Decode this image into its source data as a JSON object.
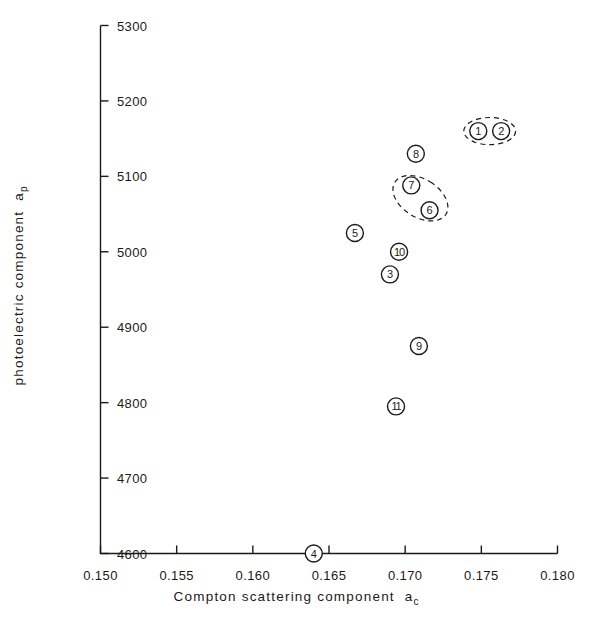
{
  "chart_data": {
    "type": "scatter",
    "title": "",
    "xlabel": "Compton scattering component a_c",
    "ylabel": "photoelectric component a_p",
    "xlabel_main": "Compton  scattering  component",
    "xlabel_sym": "a",
    "xlabel_sub": "c",
    "ylabel_main": "photoelectric  component",
    "ylabel_sym": "a",
    "ylabel_sub": "p",
    "xlim": [
      0.15,
      0.18
    ],
    "ylim": [
      4600,
      5300
    ],
    "xticks": [
      0.15,
      0.155,
      0.16,
      0.165,
      0.17,
      0.175,
      0.18
    ],
    "yticks": [
      4600,
      4700,
      4800,
      4900,
      5000,
      5100,
      5200,
      5300
    ],
    "xtick_labels": [
      "0.150",
      "0.155",
      "0.160",
      "0.165",
      "0.170",
      "0.175",
      "0.180"
    ],
    "ytick_labels": [
      "4600",
      "4700",
      "4800",
      "4900",
      "5000",
      "5100",
      "5200",
      "5300"
    ],
    "grid": false,
    "legend": "none",
    "marker_style": "circled-number",
    "points": [
      {
        "label": "1",
        "x": 0.1748,
        "y": 5160
      },
      {
        "label": "2",
        "x": 0.1763,
        "y": 5160
      },
      {
        "label": "3",
        "x": 0.169,
        "y": 4970
      },
      {
        "label": "4",
        "x": 0.164,
        "y": 4600
      },
      {
        "label": "5",
        "x": 0.1667,
        "y": 5025
      },
      {
        "label": "6",
        "x": 0.1716,
        "y": 5055
      },
      {
        "label": "7",
        "x": 0.1704,
        "y": 5088
      },
      {
        "label": "8",
        "x": 0.1707,
        "y": 5130
      },
      {
        "label": "9",
        "x": 0.1709,
        "y": 4875
      },
      {
        "label": "10",
        "x": 0.1696,
        "y": 5000
      },
      {
        "label": "11",
        "x": 0.1694,
        "y": 4795
      }
    ],
    "annotations": [
      {
        "name": "dashed-ellipse-group-1-2",
        "type": "dashed-ellipse",
        "encloses": [
          "1",
          "2"
        ],
        "cx": 0.17555,
        "cy": 5160,
        "rx_data": 0.0017,
        "ry_data": 18,
        "rotation_deg": 0
      },
      {
        "name": "dashed-ellipse-group-6-7",
        "type": "dashed-ellipse",
        "encloses": [
          "6",
          "7"
        ],
        "cx": 0.171,
        "cy": 5071,
        "rx_data": 0.00125,
        "ry_data": 40,
        "rotation_deg": -58
      }
    ],
    "axis_color": "#1a1a1a",
    "marker_color": "#1a1a1a",
    "background": "#ffffff"
  }
}
